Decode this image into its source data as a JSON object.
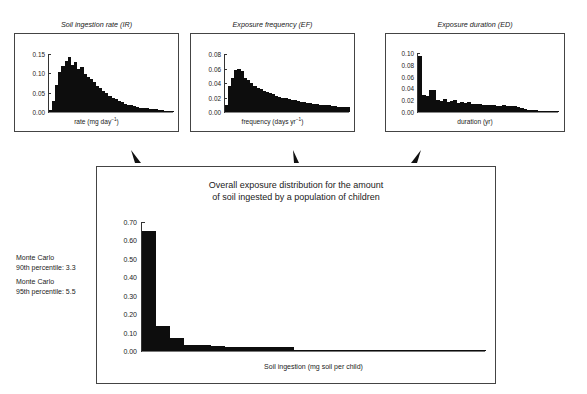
{
  "figure": {
    "background": "#ffffff",
    "ink": "#111111"
  },
  "annotations": {
    "monte_carlo_90": {
      "line1": "Monte Carlo",
      "line2": "90th percentile: 3.3"
    },
    "monte_carlo_95": {
      "line1": "Monte Carlo",
      "line2": "95th percentile: 5.5"
    }
  },
  "chart_data": [
    {
      "id": "soil-ingestion-rate",
      "type": "bar",
      "title": "Soil ingestion rate (IR)",
      "xlabel": "rate (mg day⁻¹)",
      "ylabel": "",
      "ylim": [
        0,
        0.16
      ],
      "yticks": [
        0.0,
        0.05,
        0.1,
        0.15
      ],
      "ytick_labels": [
        "0.00",
        "0.05",
        "0.10",
        "0.15"
      ],
      "grid": false,
      "legend": false,
      "categories": [
        "1",
        "2",
        "3",
        "4",
        "5",
        "6",
        "7",
        "8",
        "9",
        "10",
        "11",
        "12",
        "13",
        "14",
        "15",
        "16",
        "17",
        "18",
        "19",
        "20",
        "21",
        "22",
        "23",
        "24",
        "25",
        "26",
        "27",
        "28",
        "29",
        "30",
        "31",
        "32",
        "33",
        "34",
        "35",
        "36",
        "37",
        "38",
        "39",
        "40"
      ],
      "values": [
        0.006,
        0.03,
        0.075,
        0.11,
        0.126,
        0.14,
        0.152,
        0.131,
        0.137,
        0.118,
        0.124,
        0.104,
        0.097,
        0.09,
        0.083,
        0.073,
        0.066,
        0.059,
        0.052,
        0.045,
        0.04,
        0.035,
        0.031,
        0.027,
        0.023,
        0.02,
        0.018,
        0.016,
        0.014,
        0.012,
        0.011,
        0.01,
        0.009,
        0.008,
        0.007,
        0.006,
        0.005,
        0.004,
        0.004,
        0.003
      ]
    },
    {
      "id": "exposure-frequency",
      "type": "bar",
      "title": "Exposure frequency (EF)",
      "xlabel": "frequency (days yr⁻¹)",
      "ylabel": "",
      "ylim": [
        0,
        0.085
      ],
      "yticks": [
        0.0,
        0.02,
        0.04,
        0.06,
        0.08
      ],
      "ytick_labels": [
        "0.00",
        "0.02",
        "0.04",
        "0.06",
        "0.08"
      ],
      "grid": false,
      "legend": false,
      "categories": [
        "1",
        "2",
        "3",
        "4",
        "5",
        "6",
        "7",
        "8",
        "9",
        "10",
        "11",
        "12",
        "13",
        "14",
        "15",
        "16",
        "17",
        "18",
        "19",
        "20",
        "21",
        "22",
        "23",
        "24",
        "25",
        "26",
        "27",
        "28",
        "29",
        "30",
        "31",
        "32",
        "33",
        "34",
        "35",
        "36",
        "37",
        "38",
        "39",
        "40"
      ],
      "values": [
        0.01,
        0.038,
        0.05,
        0.061,
        0.063,
        0.06,
        0.05,
        0.047,
        0.042,
        0.038,
        0.035,
        0.033,
        0.031,
        0.029,
        0.028,
        0.026,
        0.024,
        0.022,
        0.021,
        0.02,
        0.019,
        0.018,
        0.017,
        0.016,
        0.015,
        0.014,
        0.013,
        0.013,
        0.012,
        0.012,
        0.011,
        0.011,
        0.01,
        0.01,
        0.009,
        0.009,
        0.008,
        0.008,
        0.007,
        0.007
      ]
    },
    {
      "id": "exposure-duration",
      "type": "bar",
      "title": "Exposure duration (ED)",
      "xlabel": "duration (yr)",
      "ylabel": "",
      "ylim": [
        0,
        0.105
      ],
      "yticks": [
        0.0,
        0.02,
        0.04,
        0.06,
        0.08,
        0.1
      ],
      "ytick_labels": [
        "0.00",
        "0.02",
        "0.04",
        "0.06",
        "0.08",
        "0.10"
      ],
      "grid": false,
      "legend": false,
      "categories": [
        "1",
        "2",
        "3",
        "4",
        "5",
        "6",
        "7",
        "8",
        "9",
        "10",
        "11",
        "12",
        "13",
        "14",
        "15",
        "16",
        "17",
        "18",
        "19",
        "20",
        "21",
        "22",
        "23",
        "24",
        "25",
        "26",
        "27",
        "28",
        "29",
        "30",
        "31",
        "32",
        "33",
        "34",
        "35",
        "36",
        "37",
        "38",
        "39",
        "40"
      ],
      "values": [
        0.1,
        0.03,
        0.029,
        0.04,
        0.04,
        0.022,
        0.02,
        0.023,
        0.018,
        0.02,
        0.022,
        0.016,
        0.018,
        0.016,
        0.017,
        0.014,
        0.015,
        0.014,
        0.013,
        0.012,
        0.013,
        0.012,
        0.011,
        0.011,
        0.012,
        0.011,
        0.01,
        0.01,
        0.009,
        0.008,
        0.005,
        0.004,
        0.003,
        0.003,
        0.002,
        0.002,
        0.002,
        0.001,
        0.001,
        0.001
      ]
    },
    {
      "id": "overall-exposure",
      "type": "bar",
      "title": "Overall exposure distribution for the amount of soil ingested by a population of children",
      "title_line1": "Overall exposure distribution for the amount",
      "title_line2": "of soil ingested by a population of children",
      "xlabel": "Soil ingestion (mg soil per child)",
      "ylabel": "",
      "ylim": [
        0,
        0.72
      ],
      "yticks": [
        0.0,
        0.1,
        0.2,
        0.3,
        0.4,
        0.5,
        0.6,
        0.7
      ],
      "ytick_labels": [
        "0.00",
        "0.10",
        "0.20",
        "0.30",
        "0.40",
        "0.50",
        "0.60",
        "0.70"
      ],
      "grid": false,
      "legend": false,
      "categories": [
        "1",
        "2",
        "3",
        "4",
        "5",
        "6",
        "7",
        "8",
        "9",
        "10",
        "11",
        "12",
        "13",
        "14",
        "15",
        "16",
        "17",
        "18",
        "19",
        "20",
        "21",
        "22",
        "23",
        "24",
        "25"
      ],
      "values": [
        0.67,
        0.14,
        0.07,
        0.035,
        0.035,
        0.03,
        0.025,
        0.025,
        0.022,
        0.02,
        0.02,
        0.002,
        0.001,
        0.001,
        0.001,
        0.001,
        0.001,
        0.0,
        0.0,
        0.0,
        0.0,
        0.0,
        0.0,
        0.0,
        0.0
      ]
    }
  ]
}
